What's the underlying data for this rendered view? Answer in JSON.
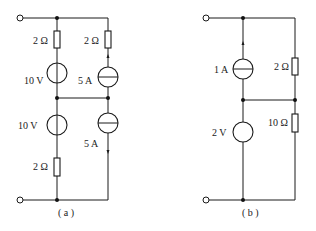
{
  "circuits": [
    {
      "caption": "( a )",
      "elements": {
        "r_top_left": "2 Ω",
        "v_top": "10 V",
        "r_top_right": "2 Ω",
        "i_top": "5 A",
        "v_bottom": "10 V",
        "i_bottom": "5 A",
        "r_bottom": "2 Ω"
      }
    },
    {
      "caption": "( b )",
      "elements": {
        "i_source": "1 A",
        "r_top": "2 Ω",
        "v_source": "2 V",
        "r_bottom": "10 Ω"
      }
    }
  ]
}
